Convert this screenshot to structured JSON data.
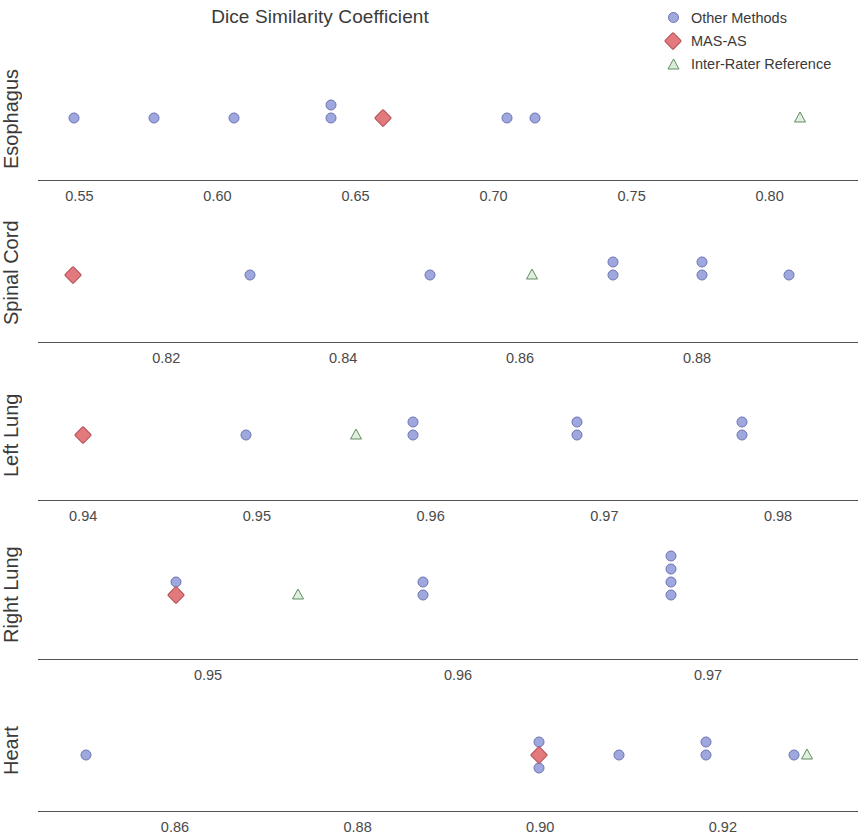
{
  "chart_data": {
    "type": "scatter",
    "title": "Dice Similarity Coefficient",
    "xlabel": "",
    "ylabel": "",
    "grid": false,
    "legend_position": "top-right",
    "legend": [
      {
        "name": "Other Methods",
        "marker": "circle",
        "color": "#9fa8dd"
      },
      {
        "name": "MAS-AS",
        "marker": "diamond",
        "color": "#e2797c"
      },
      {
        "name": "Inter-Rater Reference",
        "marker": "triangle",
        "color": "#8fbf8f"
      }
    ],
    "panels": [
      {
        "label": "Esophagus",
        "xlim": [
          0.535,
          0.832
        ],
        "ticks": [
          0.55,
          0.6,
          0.65,
          0.7,
          0.75,
          0.8
        ],
        "tick_labels": [
          "0.55",
          "0.60",
          "0.65",
          "0.70",
          "0.75",
          "0.80"
        ],
        "series": [
          {
            "name": "Other Methods",
            "marker": "circle",
            "values": [
              0.548,
              0.577,
              0.606,
              0.641,
              0.641,
              0.705,
              0.715
            ],
            "stack_levels": [
              0,
              0,
              0,
              1,
              0,
              0,
              0
            ]
          },
          {
            "name": "MAS-AS",
            "marker": "diamond",
            "values": [
              0.66
            ],
            "stack_levels": [
              0
            ]
          },
          {
            "name": "Inter-Rater Reference",
            "marker": "triangle",
            "values": [
              0.811
            ],
            "stack_levels": [
              0
            ]
          }
        ]
      },
      {
        "label": "Spinal Cord",
        "xlim": [
          0.8055,
          0.8982
        ],
        "ticks": [
          0.82,
          0.84,
          0.86,
          0.88
        ],
        "tick_labels": [
          "0.82",
          "0.84",
          "0.86",
          "0.88"
        ],
        "series": [
          {
            "name": "Other Methods",
            "marker": "circle",
            "values": [
              0.8295,
              0.8498,
              0.8705,
              0.8705,
              0.8806,
              0.8806,
              0.8904
            ],
            "stack_levels": [
              0,
              0,
              0,
              1,
              0,
              1,
              0
            ]
          },
          {
            "name": "MAS-AS",
            "marker": "diamond",
            "values": [
              0.8095
            ],
            "stack_levels": [
              0
            ]
          },
          {
            "name": "Inter-Rater Reference",
            "marker": "triangle",
            "values": [
              0.8613
            ],
            "stack_levels": [
              0
            ]
          }
        ]
      },
      {
        "label": "Left Lung",
        "xlim": [
          0.9374,
          0.9846
        ],
        "ticks": [
          0.94,
          0.95,
          0.96,
          0.97,
          0.98
        ],
        "tick_labels": [
          "0.94",
          "0.95",
          "0.96",
          "0.97",
          "0.98"
        ],
        "series": [
          {
            "name": "Other Methods",
            "marker": "circle",
            "values": [
              0.9494,
              0.959,
              0.959,
              0.9684,
              0.9684,
              0.9779,
              0.9779
            ],
            "stack_levels": [
              0,
              0,
              1,
              0,
              1,
              0,
              1
            ]
          },
          {
            "name": "MAS-AS",
            "marker": "diamond",
            "values": [
              0.94
            ],
            "stack_levels": [
              0
            ]
          },
          {
            "name": "Inter-Rater Reference",
            "marker": "triangle",
            "values": [
              0.9557
            ],
            "stack_levels": [
              0
            ]
          }
        ]
      },
      {
        "label": "Right Lung",
        "xlim": [
          0.9432,
          0.976
        ],
        "ticks": [
          0.95,
          0.96,
          0.97
        ],
        "tick_labels": [
          "0.95",
          "0.96",
          "0.97"
        ],
        "series": [
          {
            "name": "Other Methods",
            "marker": "circle",
            "values": [
              0.9487,
              0.9586,
              0.9586,
              0.9685,
              0.9685,
              0.9685,
              0.9685
            ],
            "stack_levels": [
              1,
              0,
              1,
              0,
              1,
              2,
              3
            ]
          },
          {
            "name": "MAS-AS",
            "marker": "diamond",
            "values": [
              0.9487
            ],
            "stack_levels": [
              0
            ]
          },
          {
            "name": "Inter-Rater Reference",
            "marker": "triangle",
            "values": [
              0.9536
            ],
            "stack_levels": [
              0
            ]
          }
        ]
      },
      {
        "label": "Heart",
        "xlim": [
          0.845,
          0.9348
        ],
        "ticks": [
          0.86,
          0.88,
          0.9,
          0.92
        ],
        "tick_labels": [
          "0.86",
          "0.88",
          "0.90",
          "0.92"
        ],
        "series": [
          {
            "name": "Other Methods",
            "marker": "circle",
            "values": [
              0.8503,
              0.8999,
              0.8999,
              0.9086,
              0.9182,
              0.9182,
              0.9278
            ],
            "stack_levels": [
              0,
              1,
              -1,
              0,
              0,
              1,
              0
            ]
          },
          {
            "name": "MAS-AS",
            "marker": "diamond",
            "values": [
              0.8999
            ],
            "stack_levels": [
              0
            ]
          },
          {
            "name": "Inter-Rater Reference",
            "marker": "triangle",
            "values": [
              0.9292
            ],
            "stack_levels": [
              0
            ]
          }
        ]
      }
    ]
  }
}
